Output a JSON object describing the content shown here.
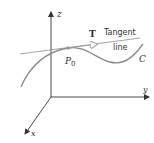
{
  "figure": {
    "axes": {
      "z_label": "z",
      "y_label": "y",
      "x_label": "x"
    },
    "curve": {
      "label": "C",
      "color": "#8a8a8a"
    },
    "point": {
      "label_main": "P",
      "label_sub": "0"
    },
    "tangent": {
      "vector_label": "T",
      "line_label_1": "Tangent",
      "line_label_2": "line",
      "color": "#9a9a9a"
    },
    "colors": {
      "axis": "#333333",
      "text": "#333333",
      "point": "#9a9a9a"
    }
  }
}
